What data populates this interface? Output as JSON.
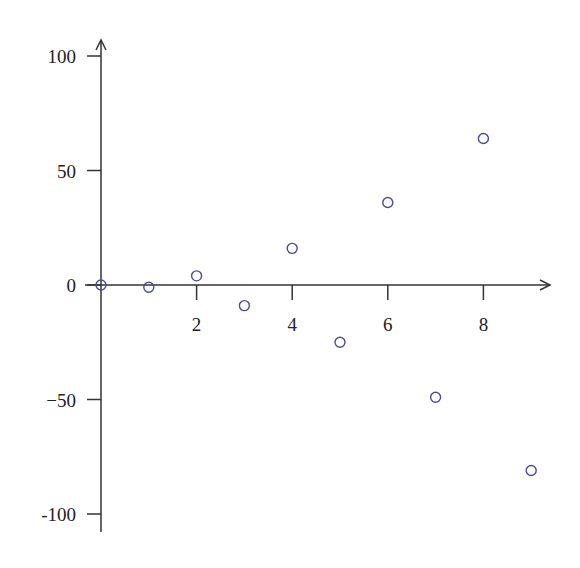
{
  "chart_data": {
    "type": "scatter",
    "title": "",
    "xlabel": "",
    "ylabel": "",
    "x": [
      0,
      1,
      2,
      3,
      4,
      5,
      6,
      7,
      8,
      9
    ],
    "y": [
      0,
      -1,
      4,
      -9,
      16,
      -25,
      36,
      -49,
      64,
      -81
    ],
    "series": [
      {
        "name": "points",
        "x": [
          0,
          1,
          2,
          3,
          4,
          5,
          6,
          7,
          8,
          9
        ],
        "values": [
          0,
          -1,
          4,
          -9,
          16,
          -25,
          36,
          -49,
          64,
          -81
        ]
      }
    ],
    "x_ticks": [
      2,
      4,
      6,
      8
    ],
    "x_tick_labels": [
      "2",
      "4",
      "6",
      "8"
    ],
    "y_ticks": [
      100,
      50,
      0,
      -50,
      -100
    ],
    "y_tick_labels": [
      "100",
      "50",
      "0",
      "−50",
      "-100"
    ],
    "xlim": [
      0,
      9.5
    ],
    "ylim": [
      -107,
      107
    ],
    "grid": false,
    "legend": null,
    "marker": "open-circle",
    "marker_color": "#4a4a9a",
    "axis_color": "#333333"
  }
}
